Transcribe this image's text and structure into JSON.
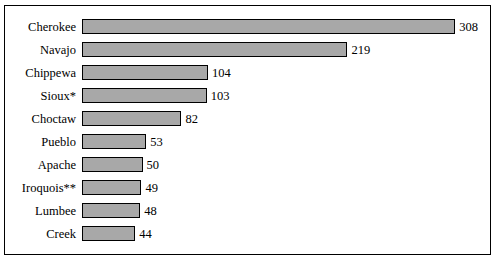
{
  "chart_data": {
    "type": "bar",
    "orientation": "horizontal",
    "title": "",
    "subtitle": "",
    "xlabel": "",
    "ylabel": "",
    "grid": false,
    "legend": null,
    "xlim": [
      0,
      330
    ],
    "categories": [
      "Cherokee",
      "Navajo",
      "Chippewa",
      "Sioux*",
      "Choctaw",
      "Pueblo",
      "Apache",
      "Iroquois**",
      "Lumbee",
      "Creek"
    ],
    "values": [
      308,
      219,
      104,
      103,
      82,
      53,
      50,
      49,
      48,
      44
    ],
    "value_labels": [
      "308",
      "219",
      "104",
      "103",
      "82",
      "53",
      "50",
      "49",
      "48",
      "44"
    ],
    "bar_fill": "#a8a8a8",
    "bar_border": "#000000",
    "frame_border": "#000000",
    "background": "#ffffff"
  }
}
